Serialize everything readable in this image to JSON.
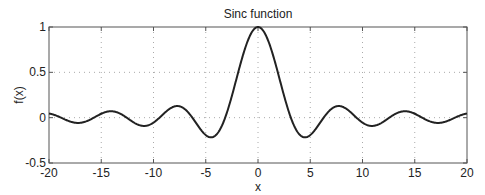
{
  "chart_data": {
    "type": "line",
    "title": "Sinc function",
    "xlabel": "x",
    "ylabel": "f(x)",
    "xlim": [
      -20,
      20
    ],
    "ylim": [
      -0.5,
      1
    ],
    "xticks": [
      -20,
      -15,
      -10,
      -5,
      0,
      5,
      10,
      15,
      20
    ],
    "xtick_labels": [
      "-20",
      "-15",
      "-10",
      "-5",
      "0",
      "5",
      "10",
      "15",
      "20"
    ],
    "yticks": [
      -0.5,
      0,
      0.5,
      1
    ],
    "ytick_labels": [
      "-0.5",
      "0",
      "0.5",
      "1"
    ],
    "grid": true,
    "grid_style": "dotted",
    "legend": null,
    "series": [
      {
        "name": "f(x) = sin(x)/x",
        "function": "sinc",
        "x_range": [
          -20,
          20
        ],
        "color": "#222222",
        "sample_points": [
          {
            "x": -20,
            "y": 0.0456
          },
          {
            "x": -17.2,
            "y": -0.058
          },
          {
            "x": -14.07,
            "y": 0.071
          },
          {
            "x": -10.9,
            "y": -0.091
          },
          {
            "x": -7.73,
            "y": 0.128
          },
          {
            "x": -4.49,
            "y": -0.217
          },
          {
            "x": 0,
            "y": 1.0
          },
          {
            "x": 4.49,
            "y": -0.217
          },
          {
            "x": 7.73,
            "y": 0.128
          },
          {
            "x": 10.9,
            "y": -0.091
          },
          {
            "x": 14.07,
            "y": 0.071
          },
          {
            "x": 17.2,
            "y": -0.058
          },
          {
            "x": 20,
            "y": 0.0456
          }
        ]
      }
    ]
  },
  "colors": {
    "line": "#222222",
    "axes": "#555555",
    "grid": "#aaaaaa",
    "background": "#ffffff"
  }
}
